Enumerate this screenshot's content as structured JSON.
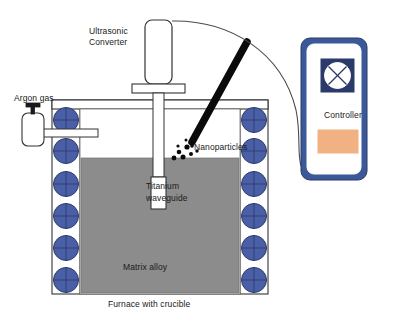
{
  "diagram": {
    "labels": {
      "ultrasonic_converter_line1": "Ultrasonic",
      "ultrasonic_converter_line2": "Converter",
      "argon_gas": "Argon gas",
      "nanoparticles": "Nanoparticles",
      "titanium_line1": "Titanium",
      "titanium_line2": "waveguide",
      "matrix_alloy": "Matrix alloy",
      "furnace": "Furnace with crucible",
      "controller": "Controller"
    },
    "colors": {
      "coil_fill": "#4a5fa5",
      "coil_stroke": "#2b3a6b",
      "melt_fill": "#8c8c8c",
      "melt_stroke": "#555555",
      "outline": "#333333",
      "controller_frame": "#3b5998",
      "controller_body": "#ffffff",
      "controller_screen": "#2b3a6b",
      "controller_screen_face": "#ffffff",
      "controller_button": "#f2b183",
      "nanoparticle_tube": "#0a0a0a",
      "cable": "#4a4a4a",
      "background": "#ffffff"
    },
    "counts": {
      "left_coils": 6,
      "right_coils": 6,
      "nanoparticle_dots": 9
    }
  }
}
